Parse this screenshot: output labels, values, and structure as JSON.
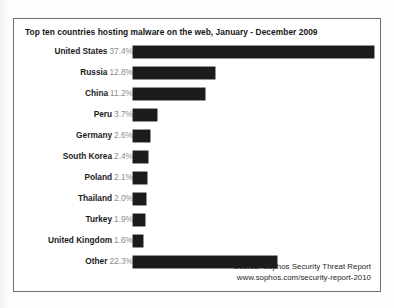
{
  "chart_data": {
    "type": "bar",
    "orientation": "horizontal",
    "title": "Top ten countries hosting malware on the web, January - December 2009",
    "xlabel": "",
    "ylabel": "",
    "grid": false,
    "legend": null,
    "axis_visible": false,
    "value_suffix": "%",
    "xlim": [
      0,
      37.4
    ],
    "categories": [
      "United States",
      "Russia",
      "China",
      "Peru",
      "Germany",
      "South Korea",
      "Poland",
      "Thailand",
      "Turkey",
      "United Kingdom",
      "Other"
    ],
    "values": [
      37.4,
      12.8,
      11.2,
      3.7,
      2.6,
      2.4,
      2.1,
      2.0,
      1.9,
      1.6,
      22.3
    ],
    "value_labels": [
      "37.4%",
      "12.8%",
      "11.2%",
      "3.7%",
      "2.6%",
      "2.4%",
      "2.1%",
      "2.0%",
      "1.9%",
      "1.6%",
      "22.3%"
    ],
    "bar_color": "#1c1c1c",
    "annotations": [
      "Source: Sophos Security Threat Report",
      "www.sophos.com/security-report-2010"
    ]
  },
  "source": {
    "line1": "Source: Sophos Security Threat Report",
    "line2": "www.sophos.com/security-report-2010"
  }
}
